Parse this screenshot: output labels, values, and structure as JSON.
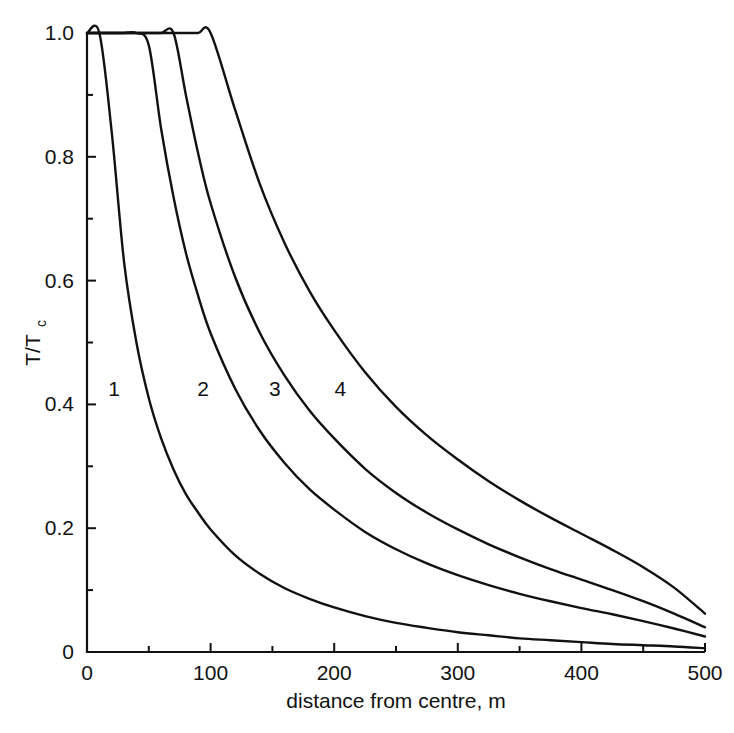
{
  "chart_data": {
    "type": "line",
    "title": "",
    "xlabel": "distance from centre, m",
    "ylabel": "T/Tc",
    "ylabel_parts": {
      "main": "T/T",
      "sub": "c"
    },
    "xlim": [
      0,
      500
    ],
    "ylim": [
      0,
      1.0
    ],
    "grid": false,
    "legend_position": "inline-curve-labels",
    "x_ticks_major": [
      0,
      100,
      200,
      300,
      400,
      500
    ],
    "x_tick_labels": [
      "0",
      "100",
      "200",
      "300",
      "400",
      "500"
    ],
    "x_ticks_minor": [
      50,
      150,
      250,
      350,
      450
    ],
    "y_ticks_major": [
      0,
      0.2,
      0.4,
      0.6,
      0.8,
      1.0
    ],
    "y_tick_labels": [
      "0",
      "0.2",
      "0.4",
      "0.6",
      "0.8",
      "1.0"
    ],
    "y_ticks_minor": [
      0.1,
      0.3,
      0.5,
      0.7,
      0.9
    ],
    "x": [
      0,
      10,
      20,
      30,
      40,
      50,
      60,
      70,
      80,
      90,
      100,
      120,
      140,
      160,
      180,
      200,
      225,
      250,
      275,
      300,
      325,
      350,
      375,
      400,
      425,
      450,
      475,
      500
    ],
    "series": [
      {
        "name": "1",
        "label": "1",
        "label_x": 22,
        "label_y": 0.425,
        "values": [
          1.0,
          1.0,
          0.84,
          0.63,
          0.5,
          0.41,
          0.345,
          0.295,
          0.255,
          0.225,
          0.198,
          0.156,
          0.126,
          0.103,
          0.086,
          0.072,
          0.058,
          0.047,
          0.039,
          0.032,
          0.027,
          0.022,
          0.019,
          0.016,
          0.013,
          0.011,
          0.009,
          0.006
        ]
      },
      {
        "name": "2",
        "label": "2",
        "label_x": 94,
        "label_y": 0.425,
        "values": [
          1.0,
          1.0,
          1.0,
          1.0,
          1.0,
          0.98,
          0.845,
          0.735,
          0.645,
          0.575,
          0.515,
          0.425,
          0.357,
          0.305,
          0.263,
          0.23,
          0.194,
          0.166,
          0.143,
          0.124,
          0.108,
          0.094,
          0.082,
          0.071,
          0.061,
          0.05,
          0.038,
          0.025
        ]
      },
      {
        "name": "3",
        "label": "3",
        "label_x": 152,
        "label_y": 0.425,
        "values": [
          1.0,
          1.0,
          1.0,
          1.0,
          1.0,
          1.0,
          1.0,
          1.0,
          0.9,
          0.805,
          0.725,
          0.605,
          0.515,
          0.446,
          0.39,
          0.345,
          0.296,
          0.257,
          0.225,
          0.198,
          0.174,
          0.153,
          0.134,
          0.117,
          0.1,
          0.082,
          0.062,
          0.04
        ]
      },
      {
        "name": "4",
        "label": "4",
        "label_x": 205,
        "label_y": 0.425,
        "values": [
          1.0,
          1.0,
          1.0,
          1.0,
          1.0,
          1.0,
          1.0,
          1.0,
          1.0,
          1.0,
          1.0,
          0.875,
          0.755,
          0.66,
          0.583,
          0.52,
          0.452,
          0.396,
          0.35,
          0.311,
          0.276,
          0.245,
          0.217,
          0.191,
          0.165,
          0.137,
          0.104,
          0.062
        ]
      }
    ]
  },
  "style": {
    "line_color": "#111111",
    "background": "#ffffff",
    "text_color": "#111111"
  }
}
